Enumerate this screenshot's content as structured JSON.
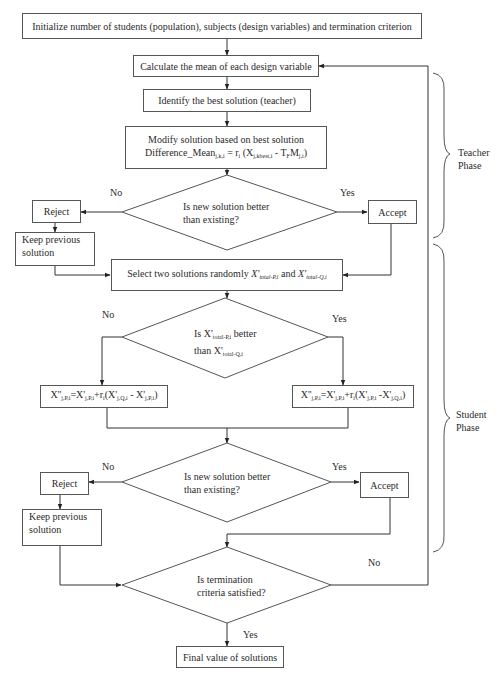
{
  "diagram": {
    "type": "flowchart",
    "nodes": {
      "init": "Initialize number of students (population), subjects (design variables) and termination criterion",
      "calc_mean": "Calculate the mean of each design variable",
      "identify_best": "Identify the best solution (teacher)",
      "modify_line1": "Modify solution based on best solution",
      "modify_line2_prefix": "Difference_Mean",
      "modify_line2_sub1": "j,k,i",
      "modify_line2_mid": " = r",
      "modify_line2_sub2": "i",
      "modify_line2_paren": " (X",
      "modify_line2_sub3": "j,kbest,i",
      "modify_line2_minus": " -  T",
      "modify_line2_sub4": "F",
      "modify_line2_m": "M",
      "modify_line2_sub5": "j,i",
      "modify_line2_close": ")",
      "decision1_line1": "Is new solution better",
      "decision1_line2": "than  existing?",
      "reject1": "Reject",
      "keep1_line1": "Keep previous",
      "keep1_line2": "solution",
      "accept1": "Accept",
      "select_prefix": "Select two solutions randomly ",
      "select_x1": "X'",
      "select_sub1": "total-P,i",
      "select_and": " and ",
      "select_x2": "X'",
      "select_sub2": "total-Q,i",
      "decision2_line1_prefix": "Is X'",
      "decision2_line1_sub": "total-P,i",
      "decision2_line1_suffix": " better",
      "decision2_line2_prefix": "than X'",
      "decision2_line2_sub": "total-Q,i",
      "formula_left": {
        "a": "X''",
        "a_sub": "j,P,i",
        "b": "=X'",
        "b_sub": "j,P,i",
        "c": "+r",
        "c_sub": "i",
        "d": "(X'",
        "d_sub": "j,Q,i",
        "e": " - X'",
        "e_sub": "j,P,i",
        "f": ")"
      },
      "formula_right": {
        "a": "X''",
        "a_sub": "j,P,i",
        "b": "=X'",
        "b_sub": "j,P,i",
        "c": "+r",
        "c_sub": "i",
        "d": "(X'",
        "d_sub": "j,P,i",
        "e": " -X'",
        "e_sub": "j,Q,i",
        "f": ")"
      },
      "decision3_line1": "Is new solution better",
      "decision3_line2": "than  existing?",
      "reject2": "Reject",
      "keep2_line1": "Keep previous",
      "keep2_line2": "solution",
      "accept2": "Accept",
      "decision4_line1": "Is termination",
      "decision4_line2": "criteria satisfied?",
      "final": "Final value of solutions"
    },
    "edge_labels": {
      "d1_no": "No",
      "d1_yes": "Yes",
      "d2_no": "No",
      "d2_yes": "Yes",
      "d3_no": "No",
      "d3_yes": "Yes",
      "d4_no": "No",
      "d4_yes": "Yes"
    },
    "phases": {
      "teacher_line1": "Teacher",
      "teacher_line2": "Phase",
      "student_line1": "Student",
      "student_line2": "Phase"
    },
    "colors": {
      "line": "#333333",
      "box_border": "#555555",
      "text": "#2a2a2a",
      "background": "#ffffff"
    }
  }
}
